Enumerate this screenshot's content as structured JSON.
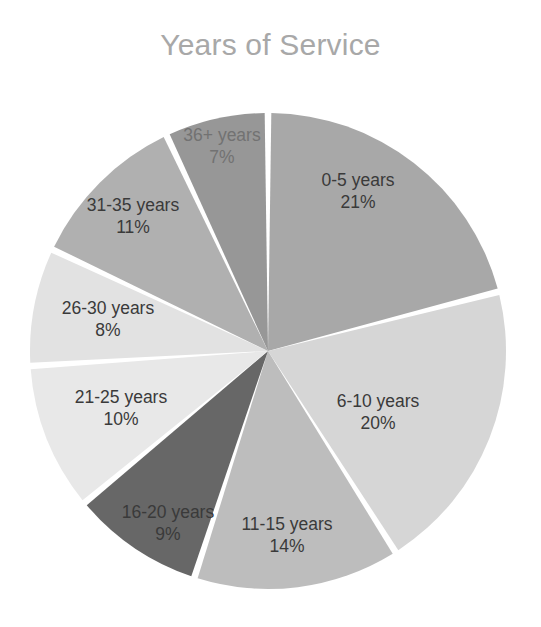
{
  "chart_data": {
    "type": "pie",
    "title": "Years of Service",
    "xlabel": "",
    "ylabel": "",
    "legend": "none",
    "grid": false,
    "value_suffix": "%",
    "start_angle_deg": 0,
    "direction": "clockwise",
    "categories": [
      "0-5 years",
      "6-10 years",
      "11-15 years",
      "16-20 years",
      "21-25 years",
      "26-30 years",
      "31-35 years",
      "36+ years"
    ],
    "values": [
      21,
      20,
      14,
      9,
      10,
      8,
      11,
      7
    ],
    "slices": [
      {
        "label": "0-5 years",
        "value": 21,
        "value_text": "21%",
        "color": "#a8a8a8",
        "label_x": 358,
        "label_y": 105,
        "faded": false
      },
      {
        "label": "6-10 years",
        "value": 20,
        "value_text": "20%",
        "color": "#d6d6d6",
        "label_x": 378,
        "label_y": 326,
        "faded": false
      },
      {
        "label": "11-15 years",
        "value": 14,
        "value_text": "14%",
        "color": "#bdbdbd",
        "label_x": 287,
        "label_y": 449,
        "faded": false
      },
      {
        "label": "16-20 years",
        "value": 9,
        "value_text": "9%",
        "color": "#676767",
        "label_x": 168,
        "label_y": 437,
        "faded": false
      },
      {
        "label": "21-25 years",
        "value": 10,
        "value_text": "10%",
        "color": "#e8e8e8",
        "label_x": 121,
        "label_y": 322,
        "faded": false
      },
      {
        "label": "26-30 years",
        "value": 8,
        "value_text": "8%",
        "color": "#e2e2e2",
        "label_x": 108,
        "label_y": 233,
        "faded": false
      },
      {
        "label": "31-35 years",
        "value": 11,
        "value_text": "11%",
        "color": "#b0b0b0",
        "label_x": 133,
        "label_y": 130,
        "faded": false
      },
      {
        "label": "36+ years",
        "value": 7,
        "value_text": "7%",
        "color": "#979797",
        "label_x": 222,
        "label_y": 60,
        "faded": true
      }
    ],
    "geometry": {
      "center_x": 268,
      "center_y": 265,
      "radius": 238,
      "gap_deg": 1.6
    }
  }
}
